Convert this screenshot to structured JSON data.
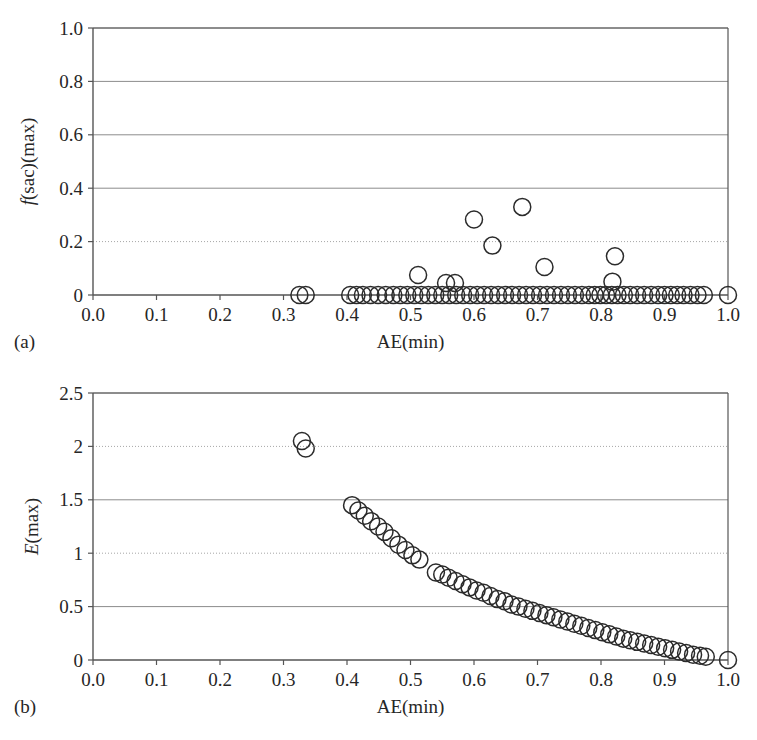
{
  "figure": {
    "background": "#ffffff",
    "marker_color": "#2b2b2b",
    "axis_color": "#555555",
    "grid_solid_color": "#8c8c8c",
    "grid_dotted_color": "#a6a6a6"
  },
  "panels": [
    {
      "tag": "(a)",
      "xlabel": "AE(min)",
      "ylabel_italic": "f",
      "ylabel_rest": "(sac)(max)",
      "xticks": [
        "0.0",
        "0.1",
        "0.2",
        "0.3",
        "0.4",
        "0.5",
        "0.6",
        "0.7",
        "0.8",
        "0.9",
        "1.0"
      ],
      "yticks": [
        "0",
        "0.2",
        "0.4",
        "0.6",
        "0.8",
        "1.0"
      ]
    },
    {
      "tag": "(b)",
      "xlabel": "AE(min)",
      "ylabel_italic": "E",
      "ylabel_rest": "(max)",
      "xticks": [
        "0.0",
        "0.1",
        "0.2",
        "0.3",
        "0.4",
        "0.5",
        "0.6",
        "0.7",
        "0.8",
        "0.9",
        "1.0"
      ],
      "yticks": [
        "0",
        "0.5",
        "1",
        "1.5",
        "2",
        "2.5"
      ]
    }
  ],
  "chart_data": [
    {
      "type": "scatter",
      "panel": "(a)",
      "title": "",
      "xlabel": "AE(min)",
      "ylabel": "f(sac)(max)",
      "xlim": [
        0.0,
        1.0
      ],
      "ylim": [
        0.0,
        1.0
      ],
      "xticks": [
        0.0,
        0.1,
        0.2,
        0.3,
        0.4,
        0.5,
        0.6,
        0.7,
        0.8,
        0.9,
        1.0
      ],
      "yticks": [
        0.0,
        0.2,
        0.4,
        0.6,
        0.8,
        1.0
      ],
      "grid": "horizontal",
      "grid_styles": {
        "0.2": "dotted",
        "0.4": "solid",
        "0.6": "solid",
        "0.8": "solid",
        "1.0": "solid"
      },
      "legend": "none",
      "marker": "open-circle",
      "annotations": [
        "Nearly all points lie on f(sac)(max)=0 baseline",
        "A handful of outliers rise to 0.07-0.33 between AE=0.51 and AE=0.83"
      ],
      "points": [
        {
          "x": 0.325,
          "y": 0.0
        },
        {
          "x": 0.335,
          "y": 0.0
        },
        {
          "x": 0.405,
          "y": 0.0
        },
        {
          "x": 0.415,
          "y": 0.0
        },
        {
          "x": 0.425,
          "y": 0.0
        },
        {
          "x": 0.437,
          "y": 0.0
        },
        {
          "x": 0.449,
          "y": 0.0
        },
        {
          "x": 0.461,
          "y": 0.0
        },
        {
          "x": 0.473,
          "y": 0.0
        },
        {
          "x": 0.484,
          "y": 0.0
        },
        {
          "x": 0.495,
          "y": 0.0
        },
        {
          "x": 0.506,
          "y": 0.0
        },
        {
          "x": 0.517,
          "y": 0.0
        },
        {
          "x": 0.528,
          "y": 0.0
        },
        {
          "x": 0.539,
          "y": 0.0
        },
        {
          "x": 0.55,
          "y": 0.0
        },
        {
          "x": 0.561,
          "y": 0.0
        },
        {
          "x": 0.572,
          "y": 0.0
        },
        {
          "x": 0.583,
          "y": 0.0
        },
        {
          "x": 0.594,
          "y": 0.0
        },
        {
          "x": 0.605,
          "y": 0.0
        },
        {
          "x": 0.616,
          "y": 0.0
        },
        {
          "x": 0.627,
          "y": 0.0
        },
        {
          "x": 0.638,
          "y": 0.0
        },
        {
          "x": 0.649,
          "y": 0.0
        },
        {
          "x": 0.66,
          "y": 0.0
        },
        {
          "x": 0.671,
          "y": 0.0
        },
        {
          "x": 0.682,
          "y": 0.0
        },
        {
          "x": 0.693,
          "y": 0.0
        },
        {
          "x": 0.704,
          "y": 0.0
        },
        {
          "x": 0.715,
          "y": 0.0
        },
        {
          "x": 0.726,
          "y": 0.0
        },
        {
          "x": 0.737,
          "y": 0.0
        },
        {
          "x": 0.748,
          "y": 0.0
        },
        {
          "x": 0.759,
          "y": 0.0
        },
        {
          "x": 0.77,
          "y": 0.0
        },
        {
          "x": 0.781,
          "y": 0.0
        },
        {
          "x": 0.79,
          "y": 0.0
        },
        {
          "x": 0.799,
          "y": 0.0
        },
        {
          "x": 0.808,
          "y": 0.0
        },
        {
          "x": 0.817,
          "y": 0.0
        },
        {
          "x": 0.826,
          "y": 0.0
        },
        {
          "x": 0.836,
          "y": 0.0
        },
        {
          "x": 0.846,
          "y": 0.0
        },
        {
          "x": 0.857,
          "y": 0.0
        },
        {
          "x": 0.868,
          "y": 0.0
        },
        {
          "x": 0.879,
          "y": 0.0
        },
        {
          "x": 0.89,
          "y": 0.0
        },
        {
          "x": 0.9,
          "y": 0.0
        },
        {
          "x": 0.91,
          "y": 0.0
        },
        {
          "x": 0.92,
          "y": 0.0
        },
        {
          "x": 0.93,
          "y": 0.0
        },
        {
          "x": 0.941,
          "y": 0.0
        },
        {
          "x": 0.952,
          "y": 0.0
        },
        {
          "x": 0.962,
          "y": 0.0
        },
        {
          "x": 1.0,
          "y": 0.0
        },
        {
          "x": 0.512,
          "y": 0.075
        },
        {
          "x": 0.556,
          "y": 0.045
        },
        {
          "x": 0.57,
          "y": 0.045
        },
        {
          "x": 0.6,
          "y": 0.283
        },
        {
          "x": 0.629,
          "y": 0.185
        },
        {
          "x": 0.676,
          "y": 0.33
        },
        {
          "x": 0.711,
          "y": 0.105
        },
        {
          "x": 0.822,
          "y": 0.145
        },
        {
          "x": 0.818,
          "y": 0.05
        }
      ]
    },
    {
      "type": "scatter",
      "panel": "(b)",
      "title": "",
      "xlabel": "AE(min)",
      "ylabel": "E(max)",
      "xlim": [
        0.0,
        1.0
      ],
      "ylim": [
        0.0,
        2.5
      ],
      "xticks": [
        0.0,
        0.1,
        0.2,
        0.3,
        0.4,
        0.5,
        0.6,
        0.7,
        0.8,
        0.9,
        1.0
      ],
      "yticks": [
        0.0,
        0.5,
        1.0,
        1.5,
        2.0,
        2.5
      ],
      "grid": "horizontal",
      "grid_styles": {
        "0.5": "solid",
        "1": "dotted",
        "1.5": "solid",
        "2": "dotted",
        "2.5": "solid"
      },
      "legend": "none",
      "marker": "open-circle",
      "annotations": [
        "Isolated pair near AE=0.33 at E(max) about 2.0",
        "Monotone decreasing branch from E=1.45 at AE=0.41 down to E=0 at AE=1.0"
      ],
      "points": [
        {
          "x": 0.329,
          "y": 2.05
        },
        {
          "x": 0.335,
          "y": 1.98
        },
        {
          "x": 0.408,
          "y": 1.45
        },
        {
          "x": 0.418,
          "y": 1.4
        },
        {
          "x": 0.428,
          "y": 1.35
        },
        {
          "x": 0.438,
          "y": 1.3
        },
        {
          "x": 0.449,
          "y": 1.25
        },
        {
          "x": 0.459,
          "y": 1.2
        },
        {
          "x": 0.47,
          "y": 1.14
        },
        {
          "x": 0.481,
          "y": 1.08
        },
        {
          "x": 0.492,
          "y": 1.03
        },
        {
          "x": 0.503,
          "y": 0.98
        },
        {
          "x": 0.514,
          "y": 0.94
        },
        {
          "x": 0.54,
          "y": 0.82
        },
        {
          "x": 0.55,
          "y": 0.8
        },
        {
          "x": 0.56,
          "y": 0.77
        },
        {
          "x": 0.571,
          "y": 0.74
        },
        {
          "x": 0.582,
          "y": 0.71
        },
        {
          "x": 0.593,
          "y": 0.68
        },
        {
          "x": 0.604,
          "y": 0.65
        },
        {
          "x": 0.615,
          "y": 0.63
        },
        {
          "x": 0.626,
          "y": 0.6
        },
        {
          "x": 0.637,
          "y": 0.57
        },
        {
          "x": 0.648,
          "y": 0.55
        },
        {
          "x": 0.659,
          "y": 0.52
        },
        {
          "x": 0.67,
          "y": 0.5
        },
        {
          "x": 0.681,
          "y": 0.48
        },
        {
          "x": 0.692,
          "y": 0.46
        },
        {
          "x": 0.703,
          "y": 0.44
        },
        {
          "x": 0.714,
          "y": 0.42
        },
        {
          "x": 0.725,
          "y": 0.4
        },
        {
          "x": 0.736,
          "y": 0.38
        },
        {
          "x": 0.747,
          "y": 0.36
        },
        {
          "x": 0.758,
          "y": 0.34
        },
        {
          "x": 0.769,
          "y": 0.32
        },
        {
          "x": 0.78,
          "y": 0.3
        },
        {
          "x": 0.791,
          "y": 0.28
        },
        {
          "x": 0.802,
          "y": 0.26
        },
        {
          "x": 0.813,
          "y": 0.24
        },
        {
          "x": 0.824,
          "y": 0.22
        },
        {
          "x": 0.835,
          "y": 0.2
        },
        {
          "x": 0.846,
          "y": 0.185
        },
        {
          "x": 0.857,
          "y": 0.17
        },
        {
          "x": 0.868,
          "y": 0.155
        },
        {
          "x": 0.879,
          "y": 0.14
        },
        {
          "x": 0.89,
          "y": 0.125
        },
        {
          "x": 0.901,
          "y": 0.11
        },
        {
          "x": 0.912,
          "y": 0.095
        },
        {
          "x": 0.923,
          "y": 0.08
        },
        {
          "x": 0.934,
          "y": 0.065
        },
        {
          "x": 0.945,
          "y": 0.05
        },
        {
          "x": 0.956,
          "y": 0.04
        },
        {
          "x": 0.965,
          "y": 0.03
        },
        {
          "x": 1.0,
          "y": 0.0
        }
      ]
    }
  ]
}
